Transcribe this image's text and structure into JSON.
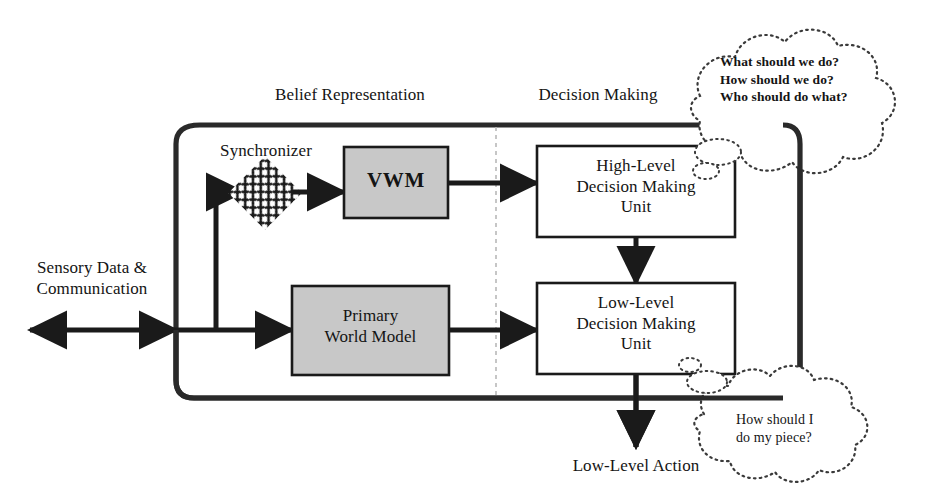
{
  "diagram": {
    "sections": [
      {
        "id": "belief",
        "label": "Belief Representation"
      },
      {
        "id": "decision",
        "label": "Decision Making"
      }
    ],
    "nodes": [
      {
        "id": "synchronizer",
        "label": "Synchronizer",
        "shape": "hatched-diamond",
        "fill": "#ffffff"
      },
      {
        "id": "vwm",
        "label": "VWM",
        "shape": "rect",
        "fill": "#c8c8c8"
      },
      {
        "id": "pwm",
        "label": "Primary\nWorld Model",
        "line1": "Primary",
        "line2": "World Model",
        "shape": "rect",
        "fill": "#c8c8c8"
      },
      {
        "id": "hldmu",
        "line1": "High-Level",
        "line2": "Decision Making",
        "line3": "Unit",
        "shape": "rect",
        "fill": "#ffffff"
      },
      {
        "id": "lldmu",
        "line1": "Low-Level",
        "line2": "Decision Making",
        "line3": "Unit",
        "shape": "rect",
        "fill": "#ffffff"
      }
    ],
    "edge_labels": [
      {
        "id": "input",
        "line1": "Sensory Data &",
        "line2": "Communication"
      },
      {
        "id": "output",
        "line1": "Low-Level Action"
      }
    ],
    "clouds": [
      {
        "id": "cloud-high",
        "lines": [
          "What should we do?",
          "How should we do?",
          "Who should do what?"
        ]
      },
      {
        "id": "cloud-low",
        "lines": [
          "How should I",
          "do my piece?"
        ]
      }
    ],
    "colors": {
      "stroke": "#1a1a1a",
      "shaded_fill": "#c8c8c8",
      "plain_fill": "#ffffff",
      "divider": "#b5b5b5",
      "background": "#ffffff"
    }
  }
}
